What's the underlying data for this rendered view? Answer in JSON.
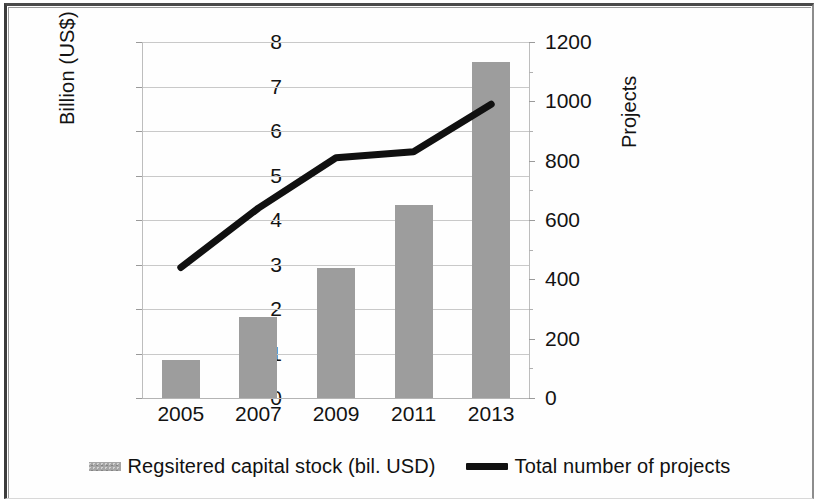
{
  "chart_data": {
    "type": "bar",
    "title": "",
    "subtitle": "",
    "categories": [
      "2005",
      "2007",
      "2009",
      "2011",
      "2013"
    ],
    "xlabel": "",
    "ylabel": "Billion (US$)",
    "y2label": "Projects",
    "ylim": [
      0,
      8
    ],
    "y2lim": [
      0,
      1200
    ],
    "yticks": [
      "8",
      "7",
      "6",
      "5",
      "4",
      "3",
      "2",
      "1",
      "0"
    ],
    "ytick_values": [
      8,
      7,
      6,
      5,
      4,
      3,
      2,
      1,
      0
    ],
    "y2ticks": [
      "1200",
      "1000",
      "800",
      "600",
      "400",
      "200",
      "0"
    ],
    "y2tick_values": [
      1200,
      1000,
      800,
      600,
      400,
      200,
      0
    ],
    "grid": true,
    "legend_position": "bottom",
    "series": [
      {
        "name": "Regsitered capital stock (bil. USD)",
        "type": "bar",
        "axis": "left",
        "color": "#9d9d9d",
        "values": [
          0.85,
          1.83,
          2.92,
          4.33,
          7.55
        ]
      },
      {
        "name": "Total number of projects",
        "type": "line",
        "axis": "right",
        "color": "#101010",
        "values": [
          440,
          640,
          810,
          830,
          990
        ]
      }
    ]
  },
  "legend": {
    "bar_label": "Regsitered capital stock (bil. USD)",
    "line_label": "Total number of projects"
  }
}
